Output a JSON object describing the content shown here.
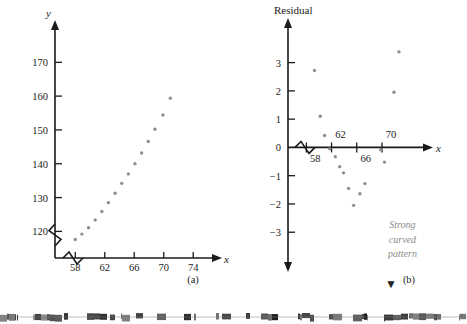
{
  "figure": {
    "panels": [
      {
        "id": "a",
        "caption": "(a)",
        "chart_data": {
          "type": "scatter",
          "title": "",
          "xlabel": "x",
          "ylabel": "y",
          "xticks": [
            58,
            62,
            66,
            70,
            74
          ],
          "yticks": [
            120,
            130,
            140,
            150,
            160,
            170
          ],
          "xlim": [
            56.2,
            75.6
          ],
          "ylim": [
            114.5,
            176
          ],
          "axis_break_x": true,
          "axis_break_y": true,
          "grid": false,
          "legend": "none",
          "point_color": "#8e8e8e",
          "points": [
            {
              "x": 58.0,
              "y": 117.6
            },
            {
              "x": 58.9,
              "y": 119.2
            },
            {
              "x": 59.8,
              "y": 121.1
            },
            {
              "x": 60.7,
              "y": 123.4
            },
            {
              "x": 61.6,
              "y": 125.9
            },
            {
              "x": 62.5,
              "y": 128.5
            },
            {
              "x": 63.4,
              "y": 131.3
            },
            {
              "x": 64.3,
              "y": 134.2
            },
            {
              "x": 65.2,
              "y": 137.0
            },
            {
              "x": 66.1,
              "y": 140.0
            },
            {
              "x": 67.0,
              "y": 143.2
            },
            {
              "x": 67.9,
              "y": 146.6
            },
            {
              "x": 68.8,
              "y": 150.2
            },
            {
              "x": 69.9,
              "y": 154.4
            },
            {
              "x": 70.9,
              "y": 159.4
            }
          ]
        }
      },
      {
        "id": "b",
        "caption": "(b)",
        "annotation": {
          "lines": [
            "Strong",
            "curved",
            "pattern"
          ],
          "color": "#8a8a8a"
        },
        "chart_data": {
          "type": "scatter",
          "title": "",
          "xlabel": "x",
          "ylabel": "Residual",
          "xticks": [
            58,
            62,
            66,
            70
          ],
          "yticks": [
            3,
            2,
            1,
            0,
            -1,
            -2,
            -3
          ],
          "ytick_labels": [
            "3",
            "2",
            "1",
            "0",
            "−1",
            "−2",
            "−3"
          ],
          "xlim": [
            56.2,
            75.4
          ],
          "ylim": [
            -3.7,
            3.8
          ],
          "axis_break_x": true,
          "grid": false,
          "legend": "none",
          "point_color": "#8e8e8e",
          "points": [
            {
              "x": 59.3,
              "y": 2.72
            },
            {
              "x": 60.2,
              "y": 1.1
            },
            {
              "x": 60.9,
              "y": 0.42
            },
            {
              "x": 61.7,
              "y": -0.05
            },
            {
              "x": 62.6,
              "y": -0.33
            },
            {
              "x": 63.3,
              "y": -0.68
            },
            {
              "x": 63.9,
              "y": -0.9
            },
            {
              "x": 64.7,
              "y": -1.45
            },
            {
              "x": 65.5,
              "y": -2.05
            },
            {
              "x": 66.5,
              "y": -1.64
            },
            {
              "x": 67.3,
              "y": -1.28
            },
            {
              "x": 69.8,
              "y": -0.08
            },
            {
              "x": 70.4,
              "y": -0.52
            },
            {
              "x": 71.9,
              "y": 1.95
            },
            {
              "x": 72.7,
              "y": 3.38
            }
          ]
        }
      }
    ]
  }
}
